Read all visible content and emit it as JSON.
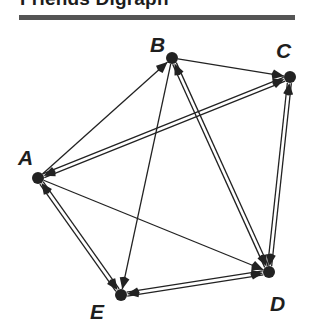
{
  "title": "Friends Digraph",
  "colors": {
    "ink": "#222222",
    "rule": "#555555",
    "background": "#ffffff"
  },
  "nodes": [
    {
      "id": "A",
      "label": "A",
      "x": 38,
      "y": 178,
      "lx": 18,
      "ly": 165
    },
    {
      "id": "B",
      "label": "B",
      "x": 172,
      "y": 58,
      "lx": 150,
      "ly": 52
    },
    {
      "id": "C",
      "label": "C",
      "x": 290,
      "y": 77,
      "lx": 276,
      "ly": 58
    },
    {
      "id": "D",
      "label": "D",
      "x": 269,
      "y": 272,
      "lx": 270,
      "ly": 311
    },
    {
      "id": "E",
      "label": "E",
      "x": 121,
      "y": 295,
      "lx": 90,
      "ly": 319
    }
  ],
  "edges": [
    {
      "from": "A",
      "to": "B",
      "bidirectional": false
    },
    {
      "from": "A",
      "to": "C",
      "bidirectional": true
    },
    {
      "from": "A",
      "to": "D",
      "bidirectional": false
    },
    {
      "from": "A",
      "to": "E",
      "bidirectional": true
    },
    {
      "from": "B",
      "to": "C",
      "bidirectional": false
    },
    {
      "from": "B",
      "to": "D",
      "bidirectional": true
    },
    {
      "from": "B",
      "to": "E",
      "bidirectional": false
    },
    {
      "from": "C",
      "to": "D",
      "bidirectional": true
    },
    {
      "from": "E",
      "to": "D",
      "bidirectional": true
    }
  ]
}
